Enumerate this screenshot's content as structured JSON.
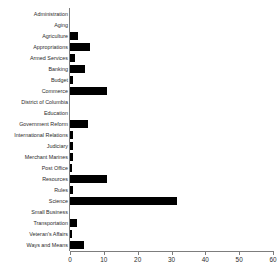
{
  "chart_data": {
    "type": "bar",
    "orientation": "horizontal",
    "title": "",
    "xlabel": "",
    "ylabel": "",
    "xlim": [
      0,
      60
    ],
    "xticks": [
      0,
      10,
      20,
      30,
      40,
      50,
      60
    ],
    "grid": false,
    "legend": null,
    "bar_color": "#000000",
    "axis_color": "#7d7d7d",
    "categories": [
      "Administration",
      "Aging",
      "Agriculture",
      "Appropriations",
      "Armed Services",
      "Banking",
      "Budget",
      "Commerce",
      "District of Columbia",
      "Education",
      "Government Reform",
      "International Relations",
      "Judiciary",
      "Merchant Marines",
      "Post Office",
      "Resources",
      "Rules",
      "Science",
      "Small Business",
      "Transportation",
      "Veteran's Affairs",
      "Ways and Means"
    ],
    "values": [
      0,
      0,
      2.5,
      6,
      1.5,
      4.5,
      1,
      11,
      0,
      0,
      5.3,
      1,
      1,
      1,
      0.5,
      11,
      1,
      31.5,
      0,
      2,
      0.5,
      4
    ]
  }
}
